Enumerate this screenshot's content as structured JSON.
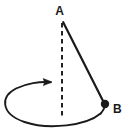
{
  "diagram": {
    "background_color": "#ffffff",
    "stroke_color": "#1a1a1a",
    "labels": {
      "apex": "A",
      "bob": "B"
    },
    "elements": {
      "pivot_label": "A",
      "bob_label": "B",
      "axis_style": "dashed",
      "string_style": "solid",
      "path_style": "ellipse",
      "rotation_direction": "counterclockwise"
    },
    "geometry": {
      "apex_point": [
        63,
        22
      ],
      "bob_point": [
        105,
        104
      ],
      "axis_top": [
        62,
        22
      ],
      "axis_bottom": [
        62,
        119
      ],
      "ellipse_center": [
        55,
        104
      ],
      "ellipse_rx": 50,
      "ellipse_ry": 22,
      "arrow_tip": [
        50,
        82
      ]
    }
  }
}
